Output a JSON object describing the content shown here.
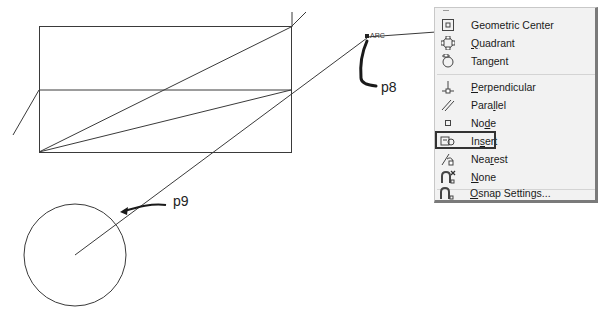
{
  "drawing": {
    "labels": {
      "p8": "p8",
      "p9": "p9",
      "snap_marker": "ARC"
    }
  },
  "osnap_menu": {
    "items": [
      {
        "label_pre": "Geometric Center",
        "label_u": "",
        "label_post": "",
        "icon": "geometric-center-icon"
      },
      {
        "label_pre": "",
        "label_u": "Q",
        "label_post": "uadrant",
        "icon": "quadrant-icon"
      },
      {
        "label_pre": "Tan",
        "label_u": "g",
        "label_post": "ent",
        "icon": "tangent-icon"
      },
      {
        "label_pre": "",
        "label_u": "P",
        "label_post": "erpendicular",
        "icon": "perpendicular-icon"
      },
      {
        "label_pre": "Para",
        "label_u": "l",
        "label_post": "lel",
        "icon": "parallel-icon"
      },
      {
        "label_pre": "No",
        "label_u": "d",
        "label_post": "e",
        "icon": "node-icon"
      },
      {
        "label_pre": "In",
        "label_u": "s",
        "label_post": "ert",
        "icon": "insert-icon",
        "selected": true
      },
      {
        "label_pre": "Nea",
        "label_u": "r",
        "label_post": "est",
        "icon": "nearest-icon"
      },
      {
        "label_pre": "",
        "label_u": "N",
        "label_post": "one",
        "icon": "none-icon"
      },
      {
        "label_pre": "",
        "label_u": "O",
        "label_post": "snap Settings...",
        "icon": "osnap-settings-icon"
      }
    ]
  }
}
